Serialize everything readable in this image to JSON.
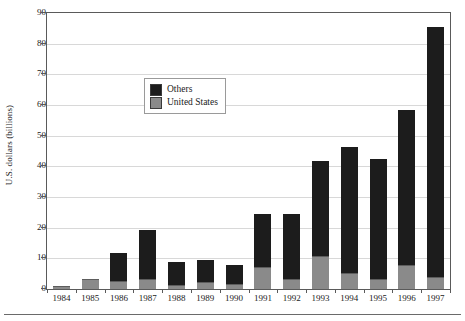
{
  "chart_data": {
    "type": "bar",
    "subtype": "stacked-vertical",
    "title": "",
    "xlabel": "",
    "ylabel": "U.S. dollars (billions)",
    "ylim": [
      0,
      90
    ],
    "ytick_step": 10,
    "yticks": [
      0,
      10,
      20,
      30,
      40,
      50,
      60,
      70,
      80,
      90
    ],
    "ytick_labels": [
      "0",
      "10",
      "20",
      "30",
      "40",
      "50",
      "60",
      "70",
      "80",
      "90"
    ],
    "grid": true,
    "grid_axis": "y",
    "legend_position": "upper-left-inside",
    "categories": [
      "1984",
      "1985",
      "1986",
      "1987",
      "1988",
      "1989",
      "1990",
      "1991",
      "1992",
      "1993",
      "1994",
      "1995",
      "1996",
      "1997"
    ],
    "series": [
      {
        "name": "United States",
        "color": "#8a8a8a",
        "values": [
          0.5,
          2.8,
          2.3,
          3.0,
          1.0,
          2.0,
          1.2,
          7.0,
          3.0,
          10.5,
          5.0,
          3.0,
          7.5,
          3.5
        ]
      },
      {
        "name": "Others",
        "color": "#1c1c1c",
        "values": [
          0.2,
          0.2,
          9.0,
          16.0,
          7.5,
          7.0,
          6.3,
          17.0,
          21.0,
          31.0,
          41.0,
          39.0,
          50.5,
          81.5
        ]
      }
    ],
    "totals": [
      0.7,
      3.0,
      11.3,
      19.0,
      8.5,
      9.0,
      7.5,
      24.0,
      24.0,
      41.5,
      46.0,
      42.0,
      58.0,
      85.0
    ]
  },
  "legend": {
    "items": [
      {
        "label": "Others",
        "swatch": "black-square-swatch"
      },
      {
        "label": "United States",
        "swatch": "gray-square-swatch"
      }
    ]
  },
  "axes": {
    "y_title": "U.S. dollars (billions)"
  }
}
